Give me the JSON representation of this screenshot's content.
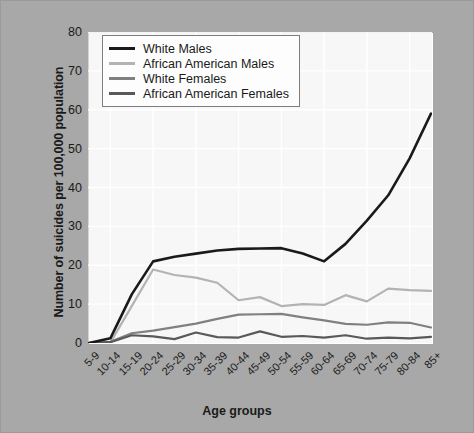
{
  "chart_data": {
    "type": "line",
    "title": "",
    "xlabel": "Age groups",
    "ylabel": "Number of suicides per 100,000 population",
    "ylim": [
      0,
      80
    ],
    "yticks": [
      0,
      10,
      20,
      30,
      40,
      50,
      60,
      70,
      80
    ],
    "grid": true,
    "legend_position": "top-left",
    "categories": [
      "5-9",
      "10-14",
      "15-19",
      "20-24",
      "25-29",
      "30-34",
      "35-39",
      "40-44",
      "45-49",
      "50-54",
      "55-59",
      "60-64",
      "65-69",
      "70-74",
      "75-79",
      "80-84",
      "85+"
    ],
    "series": [
      {
        "name": "White Males",
        "color": "#1a1a1a",
        "values": [
          0,
          1.2,
          12.5,
          21.0,
          22.2,
          23.0,
          23.8,
          24.2,
          24.3,
          24.4,
          23.0,
          21.0,
          25.5,
          31.5,
          38.0,
          47.5,
          59.0
        ]
      },
      {
        "name": "African American Males",
        "color": "#b3b3b3",
        "values": [
          0,
          0.1,
          9.5,
          18.9,
          17.5,
          16.8,
          15.5,
          11.0,
          11.8,
          9.5,
          10.0,
          9.8,
          12.3,
          10.7,
          14.0,
          13.6,
          13.4
        ]
      },
      {
        "name": "White Females",
        "color": "#808080",
        "values": [
          0,
          0.3,
          2.5,
          3.2,
          4.1,
          5.0,
          6.2,
          7.3,
          7.4,
          7.5,
          6.6,
          5.8,
          4.9,
          4.7,
          5.3,
          5.2,
          4.0
        ]
      },
      {
        "name": "African American Females",
        "color": "#595959",
        "values": [
          0,
          0.2,
          2.0,
          1.7,
          1.0,
          2.7,
          1.5,
          1.4,
          3.0,
          1.6,
          1.8,
          1.4,
          2.0,
          1.1,
          1.4,
          1.2,
          1.6
        ]
      }
    ]
  },
  "legend": {
    "items": [
      {
        "label": "White Males"
      },
      {
        "label": "African American Males"
      },
      {
        "label": "White Females"
      },
      {
        "label": "African American Females"
      }
    ]
  }
}
